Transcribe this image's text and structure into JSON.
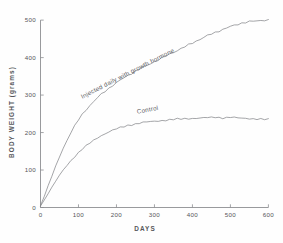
{
  "chart_data": {
    "type": "line",
    "title": "",
    "subtitle": "",
    "xlabel": "DAYS",
    "ylabel": "BODY WEIGHT (grams)",
    "xlim": [
      0,
      620
    ],
    "ylim": [
      0,
      515
    ],
    "grid": false,
    "legend_position": "inline-annotations",
    "xticks": [
      0,
      100,
      200,
      300,
      400,
      500,
      600
    ],
    "xtick_labels": [
      "0",
      "100",
      "200",
      "300",
      "400",
      "500",
      "600"
    ],
    "yticks": [
      0,
      100,
      200,
      300,
      400,
      500
    ],
    "ytick_labels": [
      "0",
      "100",
      "200",
      "300",
      "400",
      "500"
    ],
    "annotations": [
      {
        "text": "Injected daily with growth hormone",
        "series": "Injected daily with growth hormone",
        "rotation_deg": -27,
        "x_data": 110,
        "y_data": 290
      },
      {
        "text": "Control",
        "series": "Control",
        "rotation_deg": -11,
        "x_data": 255,
        "y_data": 250
      }
    ],
    "series": [
      {
        "name": "Injected daily with growth hormone",
        "x": [
          0,
          10,
          20,
          30,
          40,
          50,
          60,
          70,
          80,
          90,
          100,
          110,
          120,
          130,
          140,
          150,
          160,
          170,
          180,
          190,
          200,
          210,
          220,
          230,
          240,
          250,
          260,
          270,
          280,
          290,
          300,
          310,
          320,
          330,
          340,
          350,
          360,
          370,
          380,
          390,
          400,
          410,
          420,
          430,
          440,
          450,
          460,
          470,
          480,
          490,
          500,
          510,
          520,
          530,
          540,
          550,
          560,
          570,
          580,
          590,
          600
        ],
        "y": [
          5,
          30,
          58,
          84,
          110,
          135,
          158,
          180,
          200,
          218,
          234,
          248,
          261,
          272,
          283,
          293,
          302,
          310,
          318,
          326,
          333,
          340,
          346,
          352,
          358,
          364,
          369,
          374,
          379,
          384,
          389,
          394,
          399,
          404,
          409,
          414,
          419,
          424,
          429,
          434,
          439,
          444,
          449,
          454,
          459,
          463,
          467,
          471,
          475,
          479,
          483,
          486,
          489,
          492,
          494,
          496,
          497,
          498,
          499,
          500,
          500
        ]
      },
      {
        "name": "Control",
        "x": [
          0,
          10,
          20,
          30,
          40,
          50,
          60,
          70,
          80,
          90,
          100,
          110,
          120,
          130,
          140,
          150,
          160,
          170,
          180,
          190,
          200,
          210,
          220,
          230,
          240,
          250,
          260,
          270,
          280,
          290,
          300,
          310,
          320,
          330,
          340,
          350,
          360,
          370,
          380,
          390,
          400,
          410,
          420,
          430,
          440,
          450,
          460,
          470,
          480,
          490,
          500,
          510,
          520,
          530,
          540,
          550,
          560,
          570,
          580,
          590,
          600
        ],
        "y": [
          4,
          20,
          37,
          54,
          70,
          86,
          100,
          113,
          125,
          136,
          146,
          156,
          164,
          172,
          179,
          186,
          192,
          197,
          202,
          206,
          210,
          213,
          216,
          219,
          221,
          223,
          225,
          227,
          228,
          229,
          230,
          231,
          232,
          233,
          234,
          235,
          236,
          236,
          237,
          237,
          238,
          238,
          239,
          239,
          240,
          240,
          241,
          240,
          239,
          240,
          241,
          240,
          239,
          238,
          238,
          237,
          237,
          236,
          236,
          235,
          235
        ]
      }
    ]
  },
  "colors": {
    "curve": "#86878b",
    "axis": "#8d8e92",
    "text": "#55565a",
    "background": "#fefefe"
  }
}
